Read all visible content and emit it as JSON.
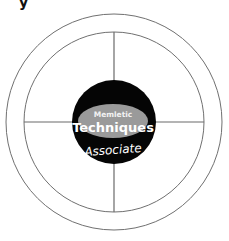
{
  "diagram": {
    "type": "concentric-circle-quadrant",
    "top_left_fragment": "y",
    "center": {
      "ellipse_label_small": "Memletic",
      "ellipse_label_main": "Techniques",
      "label_below": "Associate"
    },
    "quadrants": 4,
    "colors": {
      "core": "#050505",
      "ellipse": "#9a9a9a",
      "rings": "#707070",
      "text_on_dark": "#ffffff"
    }
  }
}
